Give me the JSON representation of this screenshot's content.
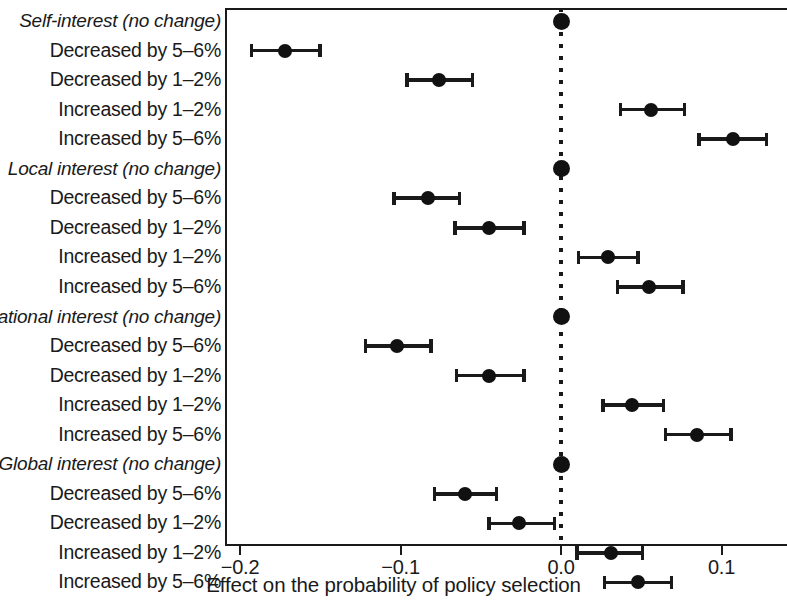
{
  "chart_data": {
    "type": "scatter",
    "subtype": "coefficient-plot-with-error-bars",
    "title": "",
    "xlabel": "Effect on the probability of policy selection",
    "ylabel": "",
    "xlim": [
      -0.21,
      0.14
    ],
    "xticks": [
      -0.2,
      -0.1,
      0.0,
      0.1
    ],
    "xticklabels": [
      "−0.2",
      "−0.1",
      "0.0",
      "0.1"
    ],
    "grid": false,
    "legend": null,
    "reference_line": 0.0,
    "reference_line_style": "dotted",
    "point_color": "#111111",
    "groups": [
      "Self-interest",
      "Local interest",
      "National interest",
      "Global interest"
    ],
    "rows": [
      {
        "label": "Self-interest (no change)",
        "reference": true,
        "estimate": 0.0,
        "ci_low": null,
        "ci_high": null
      },
      {
        "label": "Decreased by 5–6%",
        "reference": false,
        "estimate": -0.172,
        "ci_low": -0.194,
        "ci_high": -0.149
      },
      {
        "label": "Decreased by 1–2%",
        "reference": false,
        "estimate": -0.076,
        "ci_low": -0.097,
        "ci_high": -0.054
      },
      {
        "label": "Increased by 1–2%",
        "reference": false,
        "estimate": 0.056,
        "ci_low": 0.036,
        "ci_high": 0.078
      },
      {
        "label": "Increased by 5–6%",
        "reference": false,
        "estimate": 0.107,
        "ci_low": 0.085,
        "ci_high": 0.129
      },
      {
        "label": "Local interest (no change)",
        "reference": true,
        "estimate": 0.0,
        "ci_low": null,
        "ci_high": null
      },
      {
        "label": "Decreased by 5–6%",
        "reference": false,
        "estimate": -0.083,
        "ci_low": -0.105,
        "ci_high": -0.062
      },
      {
        "label": "Decreased by 1–2%",
        "reference": false,
        "estimate": -0.045,
        "ci_low": -0.067,
        "ci_high": -0.022
      },
      {
        "label": "Increased by 1–2%",
        "reference": false,
        "estimate": 0.029,
        "ci_low": 0.01,
        "ci_high": 0.049
      },
      {
        "label": "Increased by 5–6%",
        "reference": false,
        "estimate": 0.055,
        "ci_low": 0.034,
        "ci_high": 0.077
      },
      {
        "label": "National interest (no change)",
        "reference": true,
        "estimate": 0.0,
        "ci_low": null,
        "ci_high": null
      },
      {
        "label": "Decreased by 5–6%",
        "reference": false,
        "estimate": -0.102,
        "ci_low": -0.123,
        "ci_high": -0.08
      },
      {
        "label": "Decreased by 1–2%",
        "reference": false,
        "estimate": -0.045,
        "ci_low": -0.066,
        "ci_high": -0.022
      },
      {
        "label": "Increased by 1–2%",
        "reference": false,
        "estimate": 0.044,
        "ci_low": 0.025,
        "ci_high": 0.065
      },
      {
        "label": "Increased by 5–6%",
        "reference": false,
        "estimate": 0.085,
        "ci_low": 0.064,
        "ci_high": 0.107
      },
      {
        "label": "Global interest (no change)",
        "reference": true,
        "estimate": 0.0,
        "ci_low": null,
        "ci_high": null
      },
      {
        "label": "Decreased by 5–6%",
        "reference": false,
        "estimate": -0.06,
        "ci_low": -0.08,
        "ci_high": -0.039
      },
      {
        "label": "Decreased by 1–2%",
        "reference": false,
        "estimate": -0.026,
        "ci_low": -0.046,
        "ci_high": -0.003
      },
      {
        "label": "Increased by 1–2%",
        "reference": false,
        "estimate": 0.031,
        "ci_low": 0.009,
        "ci_high": 0.052
      },
      {
        "label": "Increased by 5–6%",
        "reference": false,
        "estimate": 0.048,
        "ci_low": 0.026,
        "ci_high": 0.07
      }
    ]
  }
}
